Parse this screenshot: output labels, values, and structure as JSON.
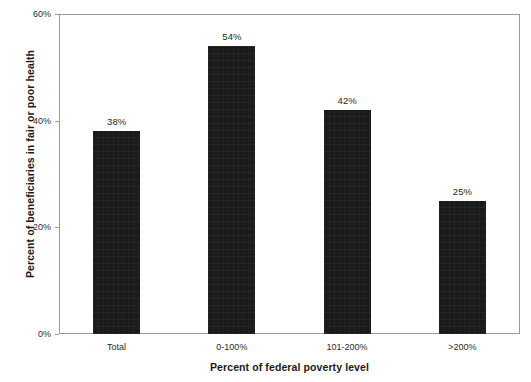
{
  "chart_data": {
    "type": "bar",
    "title": "",
    "subtitle": "",
    "categories": [
      "Total",
      "0-100%",
      "101-200%",
      ">200%"
    ],
    "values": [
      38,
      54,
      42,
      25
    ],
    "data_labels": [
      "38%",
      "54%",
      "42%",
      "25%"
    ],
    "xlabel": "Percent of federal poverty level",
    "ylabel": "Percent of beneficiaries in fair or poor health",
    "ylim": [
      0,
      60
    ],
    "ytick_values": [
      0,
      20,
      40,
      60
    ],
    "ytick_labels": [
      "0%",
      "20%",
      "40%",
      "60%"
    ],
    "grid": false,
    "legend": false,
    "legend_position": "none",
    "series": [
      {
        "name": "Percent in fair or poor health",
        "values": [
          38,
          54,
          42,
          25
        ]
      }
    ],
    "colors": {
      "bar_fill": "#1a1a1a",
      "axis_line": "#9a9a9a",
      "text": "#1a1a1a",
      "background": "#ffffff"
    }
  }
}
